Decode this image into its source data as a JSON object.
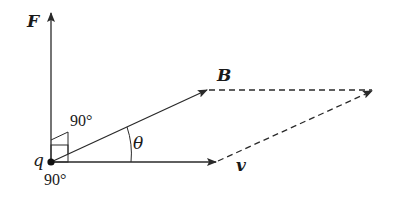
{
  "diagram": {
    "colors": {
      "stroke": "#2a2a2a",
      "background": "#ffffff"
    },
    "labels": {
      "force": "F",
      "field": "B",
      "velocity": "v",
      "charge": "q",
      "angle": "θ",
      "right_angle_upper": "90°",
      "right_angle_lower": "90°"
    },
    "vectors": [
      {
        "name": "F",
        "from": [
          51,
          162
        ],
        "to": [
          51,
          12
        ],
        "style": "solid"
      },
      {
        "name": "B",
        "from": [
          51,
          162
        ],
        "to": [
          207,
          90
        ],
        "style": "solid"
      },
      {
        "name": "v",
        "from": [
          51,
          162
        ],
        "to": [
          216,
          162
        ],
        "style": "solid"
      },
      {
        "name": "B-to-resultant",
        "from": [
          207,
          90
        ],
        "to": [
          374,
          90
        ],
        "style": "dashed"
      },
      {
        "name": "v-to-resultant",
        "from": [
          216,
          162
        ],
        "to": [
          374,
          90
        ],
        "style": "dashed"
      }
    ]
  }
}
